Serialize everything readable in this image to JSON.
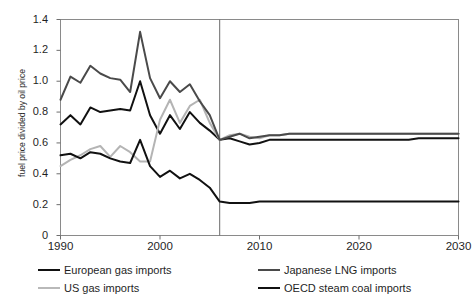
{
  "figure": {
    "title_partial": "",
    "bg_color": "#ffffff"
  },
  "chart_data": {
    "type": "line",
    "title": "",
    "xlabel": "",
    "ylabel": "fuel price divided by oil price",
    "xlim": [
      1990,
      2030
    ],
    "ylim": [
      0,
      1.4
    ],
    "xticks": [
      1990,
      2000,
      2010,
      2020,
      2030
    ],
    "ytick_labels": [
      "0",
      "0.2",
      "0.4",
      "0.6",
      "0.8",
      "1.0",
      "1.2",
      "1.4"
    ],
    "yticks": [
      0,
      0.2,
      0.4,
      0.6,
      0.8,
      1.0,
      1.2,
      1.4
    ],
    "grid": false,
    "legend_position": "below",
    "divider_year": 2006,
    "x": [
      1990,
      1991,
      1992,
      1993,
      1994,
      1995,
      1996,
      1997,
      1998,
      1999,
      2000,
      2001,
      2002,
      2003,
      2004,
      2005,
      2006,
      2007,
      2008,
      2009,
      2010,
      2011,
      2012,
      2013,
      2014,
      2015,
      2016,
      2017,
      2018,
      2019,
      2020,
      2021,
      2022,
      2023,
      2024,
      2025,
      2026,
      2027,
      2028,
      2029,
      2030
    ],
    "series": [
      {
        "name": "European gas imports",
        "color": "#111111",
        "width": 2.0,
        "values": [
          0.72,
          0.78,
          0.72,
          0.83,
          0.8,
          0.81,
          0.82,
          0.81,
          1.0,
          0.78,
          0.66,
          0.78,
          0.69,
          0.8,
          0.73,
          0.68,
          0.62,
          0.63,
          0.61,
          0.59,
          0.6,
          0.62,
          0.62,
          0.62,
          0.62,
          0.62,
          0.62,
          0.62,
          0.62,
          0.62,
          0.62,
          0.62,
          0.62,
          0.62,
          0.62,
          0.62,
          0.63,
          0.63,
          0.63,
          0.63,
          0.63
        ]
      },
      {
        "name": "US gas imports",
        "color": "#b4b4b4",
        "width": 2.0,
        "values": [
          0.45,
          0.49,
          0.52,
          0.56,
          0.58,
          0.51,
          0.58,
          0.54,
          0.48,
          0.48,
          0.75,
          0.88,
          0.73,
          0.84,
          0.88,
          0.73,
          0.62,
          0.65,
          0.66,
          0.64,
          0.63,
          0.65,
          0.65,
          0.66,
          0.66,
          0.66,
          0.66,
          0.66,
          0.66,
          0.66,
          0.66,
          0.66,
          0.66,
          0.66,
          0.66,
          0.66,
          0.66,
          0.66,
          0.66,
          0.66,
          0.66
        ]
      },
      {
        "name": "Japanese LNG imports",
        "color": "#4a4a4a",
        "width": 2.0,
        "values": [
          0.88,
          1.03,
          0.99,
          1.1,
          1.05,
          1.02,
          1.01,
          0.93,
          1.32,
          1.02,
          0.89,
          1.0,
          0.93,
          0.98,
          0.87,
          0.78,
          0.62,
          0.64,
          0.66,
          0.63,
          0.64,
          0.65,
          0.65,
          0.66,
          0.66,
          0.66,
          0.66,
          0.66,
          0.66,
          0.66,
          0.66,
          0.66,
          0.66,
          0.66,
          0.66,
          0.66,
          0.66,
          0.66,
          0.66,
          0.66,
          0.66
        ]
      },
      {
        "name": "OECD steam coal imports",
        "color": "#111111",
        "width": 2.0,
        "values": [
          0.52,
          0.53,
          0.5,
          0.54,
          0.53,
          0.5,
          0.48,
          0.47,
          0.62,
          0.45,
          0.38,
          0.42,
          0.37,
          0.4,
          0.36,
          0.31,
          0.22,
          0.21,
          0.21,
          0.21,
          0.22,
          0.22,
          0.22,
          0.22,
          0.22,
          0.22,
          0.22,
          0.22,
          0.22,
          0.22,
          0.22,
          0.22,
          0.22,
          0.22,
          0.22,
          0.22,
          0.22,
          0.22,
          0.22,
          0.22,
          0.22
        ]
      }
    ]
  },
  "legend": {
    "items": [
      {
        "label": "European gas imports",
        "color": "#111111",
        "thickness": "2.4px"
      },
      {
        "label": "US gas imports",
        "color": "#b9b9b9",
        "thickness": "2.2px"
      },
      {
        "label": "Japanese LNG imports",
        "color": "#4a4a4a",
        "thickness": "2.2px"
      },
      {
        "label": "OECD steam coal imports",
        "color": "#111111",
        "thickness": "2.4px"
      }
    ]
  }
}
